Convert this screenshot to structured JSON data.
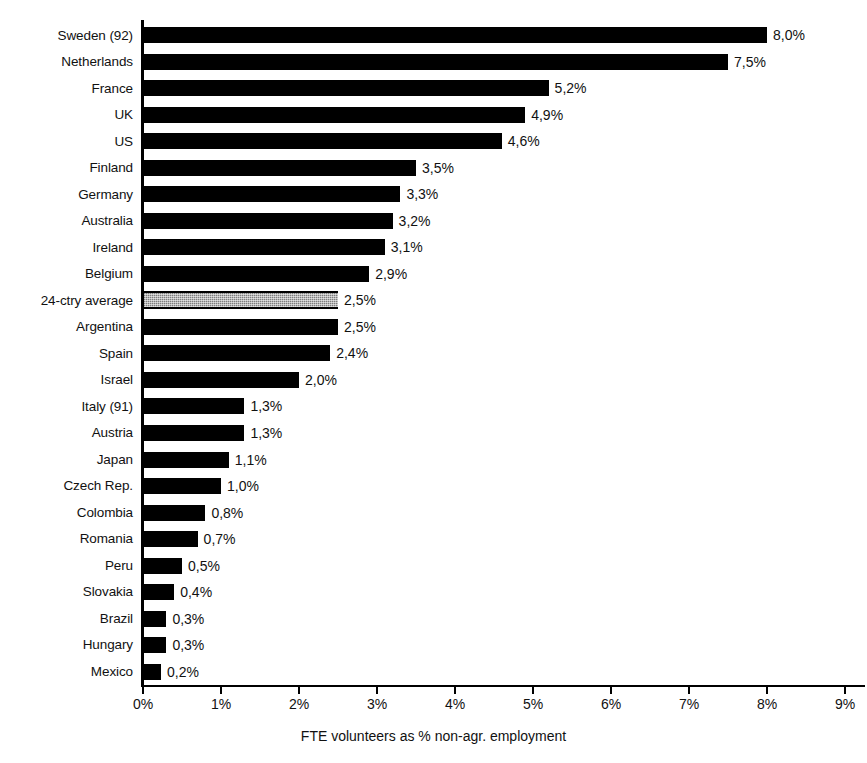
{
  "chart_data": {
    "type": "bar",
    "orientation": "horizontal",
    "title": "",
    "xlabel": "FTE volunteers as % non-agr. employment",
    "ylabel": "",
    "xlim": [
      0,
      9
    ],
    "grid": false,
    "legend": null,
    "decimal_separator": ",",
    "value_suffix": "%",
    "tick_labels": [
      "0%",
      "1%",
      "2%",
      "3%",
      "4%",
      "5%",
      "6%",
      "7%",
      "8%",
      "9%"
    ],
    "tick_values": [
      0,
      1,
      2,
      3,
      4,
      5,
      6,
      7,
      8,
      9
    ],
    "categories": [
      "Sweden (92)",
      "Netherlands",
      "France",
      "UK",
      "US",
      "Finland",
      "Germany",
      "Australia",
      "Ireland",
      "Belgium",
      "24-ctry average",
      "Argentina",
      "Spain",
      "Israel",
      "Italy (91)",
      "Austria",
      "Japan",
      "Czech Rep.",
      "Colombia",
      "Romania",
      "Peru",
      "Slovakia",
      "Brazil",
      "Hungary",
      "Mexico"
    ],
    "values": [
      8.0,
      7.5,
      5.2,
      4.9,
      4.6,
      3.5,
      3.3,
      3.2,
      3.1,
      2.9,
      2.5,
      2.5,
      2.4,
      2.0,
      1.3,
      1.3,
      1.1,
      1.0,
      0.8,
      0.7,
      0.5,
      0.4,
      0.3,
      0.3,
      0.2
    ],
    "value_labels": [
      "8,0%",
      "7,5%",
      "5,2%",
      "4,9%",
      "4,6%",
      "3,5%",
      "3,3%",
      "3,2%",
      "3,1%",
      "2,9%",
      "2,5%",
      "2,5%",
      "2,4%",
      "2,0%",
      "1,3%",
      "1,3%",
      "1,1%",
      "1,0%",
      "0,8%",
      "0,7%",
      "0,5%",
      "0,4%",
      "0,3%",
      "0,3%",
      "0,2%"
    ],
    "highlight_index": 10,
    "colors": {
      "bar": "#000000",
      "highlight_bar": "#7d7d7d",
      "axis": "#000000",
      "background": "#ffffff",
      "text": "#111111"
    }
  }
}
